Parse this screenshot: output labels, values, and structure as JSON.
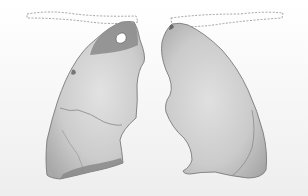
{
  "figure": {
    "parts": [
      {
        "id": "right-lung",
        "side": "left-of-image",
        "features": [
          "dark-apical-region",
          "apical-cavity",
          "dark-basal-band"
        ]
      },
      {
        "id": "left-lung",
        "side": "right-of-image",
        "features": [
          "apex-mark"
        ]
      }
    ],
    "outlines": [
      "dashed-outline-left",
      "dashed-outline-right"
    ]
  },
  "colors": {
    "background": "#ffffff",
    "bg_band": "#f2f2f2",
    "lung_fill": "#c9c9c9",
    "lung_light": "#dedede",
    "lung_edge": "#7a7a7a",
    "dark_region": "#8a8a8a",
    "dashed": "#8c8c8c"
  }
}
